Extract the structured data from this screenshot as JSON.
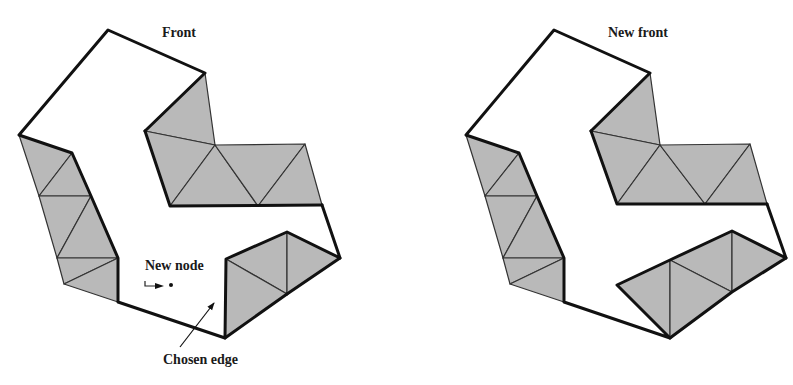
{
  "figure": {
    "panels": [
      {
        "id": "before",
        "label": "Front",
        "annotations": {
          "new_node": "New node",
          "chosen_edge": "Chosen edge"
        }
      },
      {
        "id": "after",
        "label": "New front"
      }
    ],
    "colors": {
      "fill": "#b9b9b9",
      "front_stroke": "#111111",
      "mesh_stroke": "#333333",
      "background": "#ffffff"
    }
  }
}
